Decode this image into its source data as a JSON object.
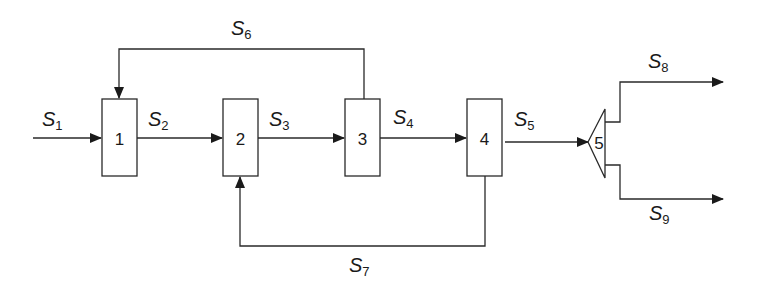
{
  "diagram": {
    "type": "process-flow",
    "units": [
      {
        "id": "1",
        "label": "1",
        "shape": "rectangle"
      },
      {
        "id": "2",
        "label": "2",
        "shape": "rectangle"
      },
      {
        "id": "3",
        "label": "3",
        "shape": "rectangle"
      },
      {
        "id": "4",
        "label": "4",
        "shape": "rectangle"
      },
      {
        "id": "5",
        "label": "5",
        "shape": "splitter-triangle"
      }
    ],
    "streams": [
      {
        "name": "S",
        "sub": "1",
        "from": "feed",
        "to": "1"
      },
      {
        "name": "S",
        "sub": "2",
        "from": "1",
        "to": "2"
      },
      {
        "name": "S",
        "sub": "3",
        "from": "2",
        "to": "3"
      },
      {
        "name": "S",
        "sub": "4",
        "from": "3",
        "to": "4"
      },
      {
        "name": "S",
        "sub": "5",
        "from": "4",
        "to": "5"
      },
      {
        "name": "S",
        "sub": "6",
        "from": "3",
        "to": "1"
      },
      {
        "name": "S",
        "sub": "7",
        "from": "4",
        "to": "2"
      },
      {
        "name": "S",
        "sub": "8",
        "from": "5",
        "to": "product"
      },
      {
        "name": "S",
        "sub": "9",
        "from": "5",
        "to": "product"
      }
    ]
  }
}
